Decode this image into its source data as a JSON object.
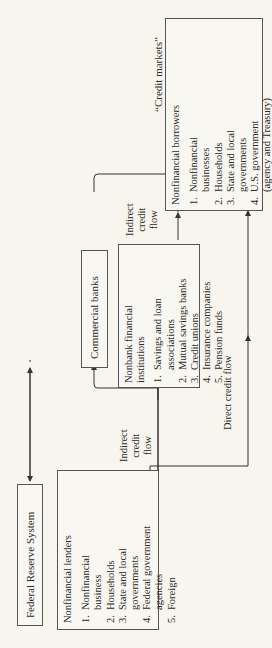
{
  "header": {
    "credit_markets_label": "“Credit markets”"
  },
  "federal_reserve": {
    "label": "Federal Reserve System"
  },
  "commercial_banks": {
    "label": "Commercial banks"
  },
  "lenders": {
    "title": "Nonfinancial lenders",
    "items": [
      {
        "num": "1.",
        "lines": [
          "Nonfinancial",
          "business"
        ]
      },
      {
        "num": "2.",
        "lines": [
          "Households"
        ]
      },
      {
        "num": "3.",
        "lines": [
          "State and local",
          "governments"
        ]
      },
      {
        "num": "4.",
        "lines": [
          "Federal government",
          "agencies"
        ]
      },
      {
        "num": "5.",
        "lines": [
          "Foreign"
        ]
      }
    ]
  },
  "nonbank": {
    "title_lines": [
      "Nonbank financial",
      "institutions"
    ],
    "items": [
      {
        "num": "1.",
        "lines": [
          "Savings and loan",
          "associations"
        ]
      },
      {
        "num": "2.",
        "lines": [
          "Mutual savings banks"
        ]
      },
      {
        "num": "3.",
        "lines": [
          "Credit unions"
        ]
      },
      {
        "num": "4.",
        "lines": [
          "Insurance companies"
        ]
      },
      {
        "num": "5.",
        "lines": [
          "Pension funds"
        ]
      }
    ]
  },
  "borrowers": {
    "title": "Nonfinancial borrowers",
    "items": [
      {
        "num": "1.",
        "lines": [
          "Nonfinancial",
          "businesses"
        ]
      },
      {
        "num": "2.",
        "lines": [
          "Households"
        ]
      },
      {
        "num": "3.",
        "lines": [
          "State and local",
          "governments"
        ]
      },
      {
        "num": "4.",
        "lines": [
          "U.S. government",
          "(agency and Treasury)"
        ]
      },
      {
        "num": "5.",
        "lines": [
          "Foreign"
        ]
      }
    ]
  },
  "flows": {
    "indirect_lower": [
      "Indirect",
      "credit",
      "flow"
    ],
    "indirect_upper": [
      "Indirect",
      "credit",
      "flow"
    ],
    "direct": "Direct credit flow"
  }
}
